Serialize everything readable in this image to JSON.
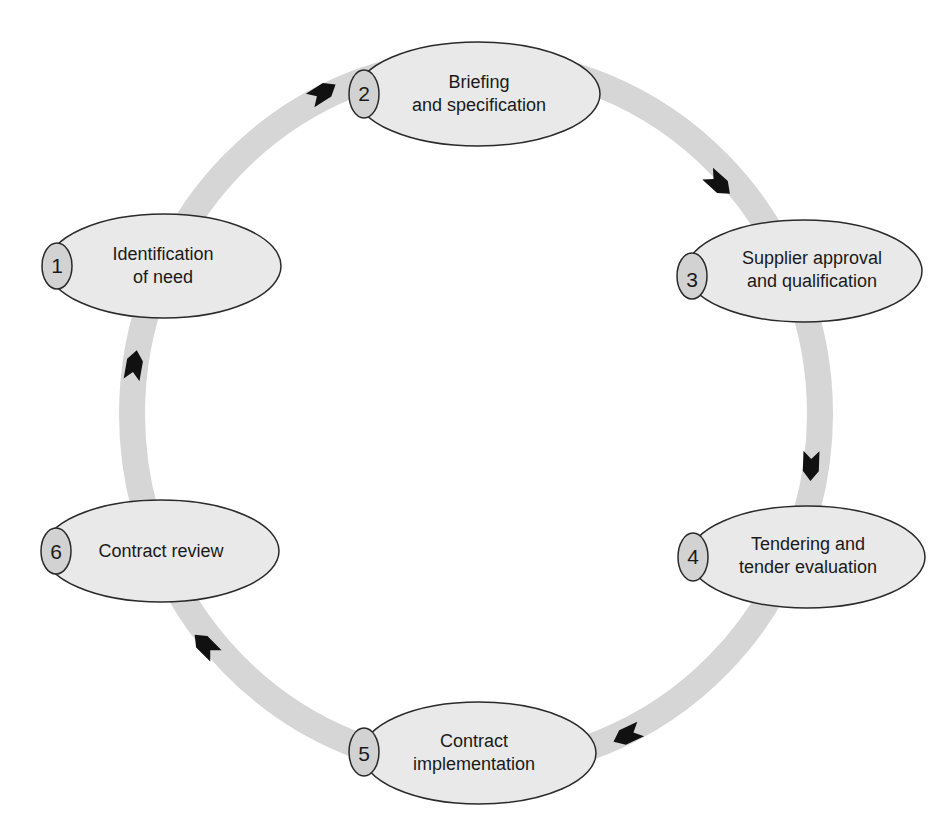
{
  "diagram": {
    "type": "cycle",
    "colors": {
      "ring": "#d6d6d6",
      "node_fill": "#e9e9e9",
      "badge_fill": "#d2d2d2",
      "stroke": "#2a2a2a",
      "arrow": "#111111"
    },
    "nodes": [
      {
        "number": "1",
        "line1": "Identification",
        "line2": "of need"
      },
      {
        "number": "2",
        "line1": "Briefing",
        "line2": "and specification"
      },
      {
        "number": "3",
        "line1": "Supplier approval",
        "line2": "and qualification"
      },
      {
        "number": "4",
        "line1": "Tendering and",
        "line2": "tender evaluation"
      },
      {
        "number": "5",
        "line1": "Contract",
        "line2": "implementation"
      },
      {
        "number": "6",
        "line1": "Contract review",
        "line2": ""
      }
    ],
    "edges": [
      {
        "from": "1",
        "to": "2"
      },
      {
        "from": "2",
        "to": "3"
      },
      {
        "from": "3",
        "to": "4"
      },
      {
        "from": "4",
        "to": "5"
      },
      {
        "from": "5",
        "to": "6"
      },
      {
        "from": "6",
        "to": "1"
      }
    ]
  }
}
